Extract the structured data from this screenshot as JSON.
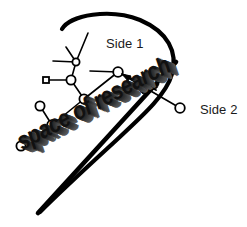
{
  "diagram": {
    "title_text": "space of research",
    "labels": {
      "side1": "Side 1",
      "side2": "Side 2"
    },
    "colors": {
      "ink": "#111111",
      "stroke": "#000000",
      "background": "#ffffff",
      "shadow": "#5a5a5a"
    },
    "boundary_curve": {
      "name": "space-of-research-boundary",
      "description": "teardrop cone outline",
      "path": "M 62 29 C 70 15, 110 8, 140 20 C 168 32, 178 52, 172 74 C 166 96, 140 118, 110 146 C 86 168, 60 192, 40 212"
    },
    "thick_baseline": {
      "name": "lower-boundary-line",
      "path": "M 38 213 L 176 62"
    },
    "graph": {
      "nodes": [
        {
          "id": "n1",
          "shape": "circle",
          "cx": 76,
          "cy": 62,
          "r": 4
        },
        {
          "id": "n2",
          "shape": "circle",
          "cx": 71,
          "cy": 80,
          "r": 5
        },
        {
          "id": "n3",
          "shape": "square",
          "cx": 46,
          "cy": 80,
          "r": 3
        },
        {
          "id": "n4",
          "shape": "circle",
          "cx": 84,
          "cy": 99,
          "r": 5
        },
        {
          "id": "n5",
          "shape": "circle",
          "cx": 52,
          "cy": 125,
          "r": 5
        },
        {
          "id": "n6",
          "shape": "circle",
          "cx": 40,
          "cy": 106,
          "r": 5
        },
        {
          "id": "n7",
          "shape": "circle",
          "cx": 21,
          "cy": 146,
          "r": 5
        },
        {
          "id": "n8",
          "shape": "circle",
          "cx": 118,
          "cy": 72,
          "r": 5
        },
        {
          "id": "n9",
          "shape": "circle",
          "cx": 180,
          "cy": 108,
          "r": 5
        }
      ],
      "edges": [
        {
          "from": "n1",
          "to": "n2"
        },
        {
          "from": "n3",
          "to": "n2"
        },
        {
          "from": "n2",
          "to": "n4"
        },
        {
          "from": "n4",
          "to": "n5"
        },
        {
          "from": "n5",
          "to": "n6"
        },
        {
          "from": "n5",
          "to": "n7"
        },
        {
          "from": "n4",
          "to": "n8"
        },
        {
          "from": "n8",
          "to": "n9"
        }
      ],
      "free_strokes": [
        {
          "name": "branch-up-right",
          "path": "M 76 62 L 88 33"
        },
        {
          "name": "branch-up-left",
          "path": "M 76 62 L 66 47"
        },
        {
          "name": "branch-left",
          "path": "M 76 62 L 53 61"
        },
        {
          "name": "branch-from-n8-left",
          "path": "M 118 72 L 90 71"
        }
      ]
    },
    "annotation_arrow": {
      "name": "pointer-arrow-to-node",
      "path": "M 155 92 L 122 74",
      "tail_wedge": "M 141 90 L 157 85 L 143 83 Z"
    }
  }
}
